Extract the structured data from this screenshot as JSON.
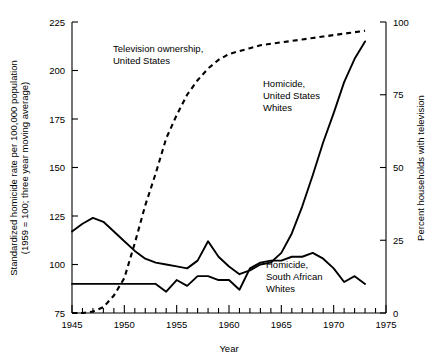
{
  "chart_data": {
    "type": "line",
    "title": "",
    "xlabel": "Year",
    "ylabel": "Standardized homicide rate per 100,000 population (1959 = 100; three year moving average)",
    "ylabel_line1": "Standardized homicide rate per 100,000 population",
    "ylabel_line2": "(1959 = 100; three year moving average)",
    "y2label": "Percent households with television",
    "xlim": [
      1945,
      1975
    ],
    "ylim": [
      75,
      225
    ],
    "y2lim": [
      0,
      100
    ],
    "xticks": [
      1945,
      1950,
      1955,
      1960,
      1965,
      1970,
      1975
    ],
    "xticks_minor_step": 1,
    "yticks": [
      75,
      100,
      125,
      150,
      175,
      200,
      225
    ],
    "y2ticks": [
      0,
      25,
      50,
      75,
      100
    ],
    "grid": false,
    "legend": "annotations-inline",
    "series": [
      {
        "name": "Homicide, United States Whites",
        "axis": "left",
        "style": "solid",
        "label_lines": [
          "Homicide,",
          "United States",
          "Whites"
        ],
        "x": [
          1945,
          1946,
          1947,
          1948,
          1949,
          1950,
          1951,
          1952,
          1953,
          1954,
          1955,
          1956,
          1957,
          1958,
          1959,
          1960,
          1961,
          1962,
          1963,
          1964,
          1965,
          1966,
          1967,
          1968,
          1969,
          1970,
          1971,
          1972,
          1973
        ],
        "values": [
          117,
          121,
          124,
          122,
          117,
          112,
          107,
          103,
          101,
          100,
          99,
          98,
          102,
          112,
          104,
          99,
          95,
          97,
          100,
          101,
          106,
          116,
          130,
          146,
          163,
          178,
          194,
          206,
          215
        ]
      },
      {
        "name": "Homicide, South African Whites",
        "axis": "left",
        "style": "solid",
        "label_lines": [
          "Homicide,",
          "South African",
          "Whites"
        ],
        "x": [
          1945,
          1946,
          1947,
          1948,
          1949,
          1950,
          1951,
          1952,
          1953,
          1954,
          1955,
          1956,
          1957,
          1958,
          1959,
          1960,
          1961,
          1962,
          1963,
          1964,
          1965,
          1966,
          1967,
          1968,
          1969,
          1970,
          1971,
          1972,
          1973
        ],
        "values": [
          90,
          90,
          90,
          90,
          90,
          90,
          90,
          90,
          90,
          86,
          92,
          89,
          94,
          94,
          92,
          92,
          87,
          98,
          101,
          102,
          102,
          104,
          104,
          106,
          103,
          98,
          91,
          94,
          90
        ]
      },
      {
        "name": "Television ownership, United States",
        "axis": "right",
        "style": "dashed",
        "label_lines": [
          "Television ownership,",
          "United States"
        ],
        "x": [
          1945,
          1946,
          1947,
          1948,
          1949,
          1950,
          1951,
          1952,
          1953,
          1954,
          1955,
          1956,
          1957,
          1958,
          1959,
          1960,
          1961,
          1962,
          1963,
          1964,
          1965,
          1966,
          1967,
          1968,
          1969,
          1970,
          1971,
          1972,
          1973
        ],
        "values": [
          0,
          0,
          0.5,
          2,
          6,
          12,
          24,
          37,
          48,
          60,
          68,
          75,
          80,
          84,
          87,
          89,
          90,
          91,
          92,
          92.5,
          93,
          93.5,
          94,
          94.5,
          95,
          95.5,
          96,
          96.5,
          97
        ]
      }
    ]
  },
  "annotations": {
    "tv_label_lines": [
      "Television ownership,",
      "United States"
    ],
    "us_homicide_label_lines": [
      "Homicide,",
      "United States",
      "Whites"
    ],
    "sa_homicide_label_lines": [
      "Homicide,",
      "South African",
      "Whites"
    ]
  }
}
